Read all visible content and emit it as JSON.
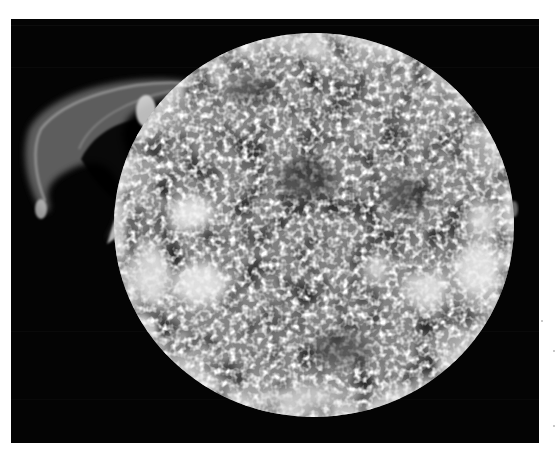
{
  "image": {
    "subject": "solar-disk-with-prominence",
    "style": "grayscale photograph",
    "colors": {
      "page_background": "#ffffff",
      "frame_background": "#040404",
      "disk_base": "#8a8a8a",
      "plage_bright": "#f2f2f2",
      "prominence": "#9a9a9a"
    },
    "frame": {
      "x": 11,
      "y": 19,
      "width": 528,
      "height": 424
    },
    "disk": {
      "cx": 314,
      "cy": 225,
      "rx": 200,
      "ry": 192
    }
  }
}
